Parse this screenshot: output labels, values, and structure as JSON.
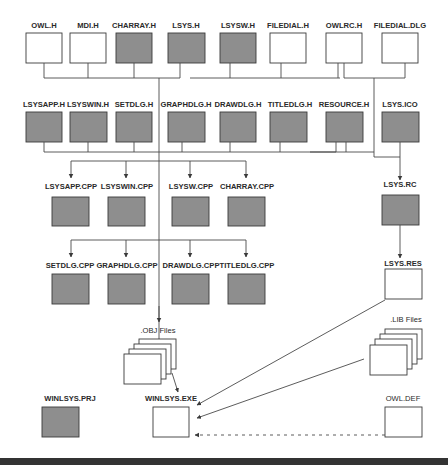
{
  "diagram": {
    "title": "",
    "colors": {
      "source_file_fill": "#8e8e8e",
      "generated_file_fill": "#ffffff",
      "line": "#4a4a4a",
      "bottom_bar": "#333333"
    },
    "row1": {
      "owl_h": "OWL.H",
      "mdi_h": "MDI.H",
      "charray_h": "CHARRAY.H",
      "lsys_h": "LSYS.H",
      "lsysw_h": "LSYSW.H",
      "filedial_h": "FILEDIAL.H",
      "owlrc_h": "OWLRC.H",
      "filedial_dlg": "FILEDIAL.DLG"
    },
    "row2": {
      "lsysapp_h": "LSYSAPP.H",
      "lsyswin_h": "LSYSWIN.H",
      "setdlg_h": "SETDLG.H",
      "graphdlg_h": "GRAPHDLG.H",
      "drawdlg_h": "DRAWDLG.H",
      "titledlg_h": "TITLEDLG.H",
      "resource_h": "RESOURCE.H",
      "lsys_ico": "LSYS.ICO"
    },
    "row3": {
      "lsysapp_cpp": "LSYSAPP.CPP",
      "lsyswin_cpp": "LSYSWIN.CPP",
      "lsysw_cpp": "LSYSW.CPP",
      "charray_cpp": "CHARRAY.CPP",
      "lsys_rc": "LSYS.RC"
    },
    "row4": {
      "setdlg_cpp": "SETDLG.CPP",
      "graphdlg_cpp": "GRAPHDLG.CPP",
      "drawdlg_cpp": "DRAWDLG.CPP",
      "titledlg_cpp": "TITLEDLG.CPP",
      "lsys_res": "LSYS.RES"
    },
    "intermediate": {
      "obj_files": ".OBJ Files",
      "lib_files": ".LIB Files"
    },
    "bottom": {
      "winlsys_prj": "WINLSYS.PRJ",
      "winlsys_exe": "WINLSYS.EXE",
      "owl_def": "OWL.DEF"
    },
    "legend_meaning": {
      "gray_box": "source file",
      "white_box": "supplied/generated file"
    }
  }
}
